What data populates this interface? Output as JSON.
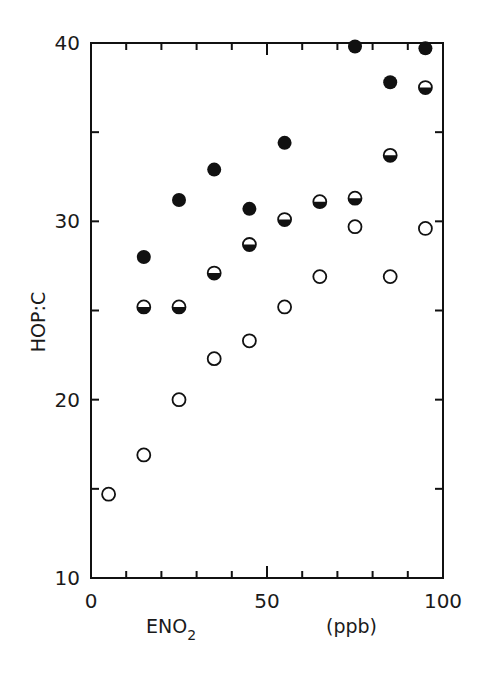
{
  "chart_data": {
    "type": "scatter",
    "title": "",
    "xlabel": "ENO2",
    "xlabel_main": "ENO",
    "xlabel_sub": "2",
    "xunit": "(ppb)",
    "ylabel": "HOP:C",
    "xlim": [
      0,
      100
    ],
    "ylim": [
      10,
      40
    ],
    "x_ticks_major": [
      0,
      50,
      100
    ],
    "x_tick_labels": [
      "0",
      "50",
      "100"
    ],
    "x_ticks_minor": [
      10,
      20,
      30,
      40,
      60,
      70,
      80,
      90
    ],
    "y_ticks_major": [
      10,
      20,
      30,
      40
    ],
    "y_tick_labels": [
      "10",
      "20",
      "30",
      "40"
    ],
    "y_ticks_minor": [
      15,
      25,
      35
    ],
    "grid": false,
    "legend": null,
    "series": [
      {
        "name": "filled circles",
        "marker": "filled-circle",
        "points": [
          {
            "x": 15,
            "y": 28.0
          },
          {
            "x": 25,
            "y": 31.2
          },
          {
            "x": 35,
            "y": 32.9
          },
          {
            "x": 45,
            "y": 30.7
          },
          {
            "x": 55,
            "y": 34.4
          },
          {
            "x": 75,
            "y": 39.8
          },
          {
            "x": 85,
            "y": 37.8
          },
          {
            "x": 95,
            "y": 39.7
          }
        ]
      },
      {
        "name": "half-filled circles",
        "marker": "half-filled-circle",
        "points": [
          {
            "x": 15,
            "y": 25.2
          },
          {
            "x": 25,
            "y": 25.2
          },
          {
            "x": 35,
            "y": 27.1
          },
          {
            "x": 45,
            "y": 28.7
          },
          {
            "x": 55,
            "y": 30.1
          },
          {
            "x": 65,
            "y": 31.1
          },
          {
            "x": 75,
            "y": 31.3
          },
          {
            "x": 85,
            "y": 33.7
          },
          {
            "x": 95,
            "y": 37.5
          }
        ]
      },
      {
        "name": "open circles",
        "marker": "open-circle",
        "points": [
          {
            "x": 5,
            "y": 14.7
          },
          {
            "x": 15,
            "y": 16.9
          },
          {
            "x": 25,
            "y": 20.0
          },
          {
            "x": 35,
            "y": 22.3
          },
          {
            "x": 45,
            "y": 23.3
          },
          {
            "x": 55,
            "y": 25.2
          },
          {
            "x": 65,
            "y": 26.9
          },
          {
            "x": 75,
            "y": 29.7
          },
          {
            "x": 85,
            "y": 26.9
          },
          {
            "x": 95,
            "y": 29.6
          }
        ]
      }
    ]
  },
  "colors": {
    "ink": "#111111",
    "background": "#ffffff"
  }
}
